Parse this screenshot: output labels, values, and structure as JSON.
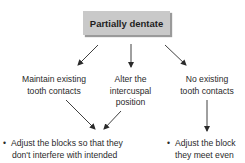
{
  "diagram": {
    "root": {
      "label": "Partially dentate"
    },
    "branches": [
      {
        "label_line1": "Maintain existing",
        "label_line2": "tooth contacts"
      },
      {
        "label_line1": "Alter the",
        "label_line2": "intercuspal",
        "label_line3": "position"
      },
      {
        "label_line1": "No existing",
        "label_line2": "tooth contacts"
      }
    ],
    "outcomes": [
      {
        "bullet": "•",
        "line1": "Adjust the blocks so that they",
        "line2": "don't interfere with intended"
      },
      {
        "bullet": "•",
        "line1": "Adjust the block",
        "line2": "they meet even"
      }
    ]
  }
}
